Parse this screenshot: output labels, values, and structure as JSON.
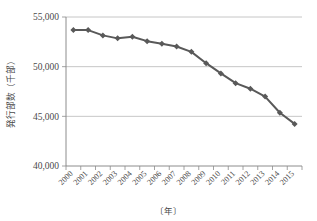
{
  "chart_data": {
    "type": "line",
    "title": "",
    "xlabel": "〔年〕",
    "ylabel": "発行部数（千部）",
    "x": [
      2000,
      2001,
      2002,
      2003,
      2004,
      2005,
      2006,
      2007,
      2008,
      2009,
      2010,
      2011,
      2012,
      2013,
      2014,
      2015
    ],
    "categories": [
      "2000",
      "2001",
      "2002",
      "2003",
      "2004",
      "2005",
      "2006",
      "2007",
      "2008",
      "2009",
      "2010",
      "2011",
      "2012",
      "2013",
      "2014",
      "2015"
    ],
    "values": [
      53700,
      53680,
      53150,
      52850,
      53020,
      52570,
      52310,
      52030,
      51490,
      50350,
      49320,
      48340,
      47780,
      46990,
      45360,
      44240
    ],
    "series": [
      {
        "name": "発行部数",
        "values": [
          53700,
          53680,
          53150,
          52850,
          53020,
          52570,
          52310,
          52030,
          51490,
          50350,
          49320,
          48340,
          47780,
          46990,
          45360,
          44240
        ],
        "color": "#595959",
        "marker": "diamond"
      }
    ],
    "ylim": [
      40000,
      55000
    ],
    "ytick_values": [
      40000,
      45000,
      50000,
      55000
    ],
    "ytick_labels": [
      "40,000",
      "45,000",
      "50,000",
      "55,000"
    ],
    "grid": true,
    "legend": false,
    "legend_position": "none",
    "xtick_rotation": 45
  },
  "colors": {
    "series": "#595959",
    "gridline": "#b7b7b7",
    "axis": "#7f7f7f",
    "text": "#4a4a4a",
    "background": "#ffffff"
  },
  "axes": {
    "y_title": "発行部数（千部）",
    "x_title": "〔年〕"
  }
}
